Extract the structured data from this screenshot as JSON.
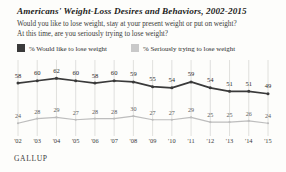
{
  "header": {
    "title": "Americans' Weight-Loss Desires and Behaviors, 2002-2015",
    "subtitle_line1": "Would you like to lose weight, stay at your present weight or put on weight?",
    "subtitle_line2": "At this time, are you seriously trying to lose weight?"
  },
  "legend": {
    "items": [
      {
        "label": "% Would like to lose weight",
        "color": "#3a3a3a",
        "swatch": "legend-swatch-dark"
      },
      {
        "label": "% Seriously trying to lose weight",
        "color": "#c9c9c9",
        "swatch": "legend-swatch-light"
      }
    ]
  },
  "footer": {
    "brand": "GALLUP"
  },
  "colors": {
    "line_dark": "#3a3a3a",
    "line_light": "#bdbdbd",
    "gridline": "#d8d8d6",
    "background": "#fdfdfb",
    "text": "#2b2b2b"
  },
  "chart_data": {
    "type": "line",
    "title": "Americans' Weight-Loss Desires and Behaviors, 2002-2015",
    "xlabel": "",
    "ylabel": "",
    "ylim": [
      0,
      70
    ],
    "grid": "vertical",
    "legend_position": "top",
    "categories": [
      "'02",
      "'03",
      "'04",
      "'05",
      "'06",
      "'07",
      "'08",
      "'09",
      "'10",
      "'11",
      "'12",
      "'13",
      "'14",
      "'15"
    ],
    "series": [
      {
        "name": "% Would like to lose weight",
        "color": "#3a3a3a",
        "values": [
          58,
          60,
          62,
          60,
          58,
          60,
          59,
          55,
          54,
          59,
          54,
          51,
          51,
          49
        ]
      },
      {
        "name": "% Seriously trying to lose weight",
        "color": "#bdbdbd",
        "values": [
          24,
          28,
          29,
          27,
          28,
          28,
          30,
          27,
          27,
          29,
          25,
          25,
          26,
          24
        ]
      }
    ]
  }
}
